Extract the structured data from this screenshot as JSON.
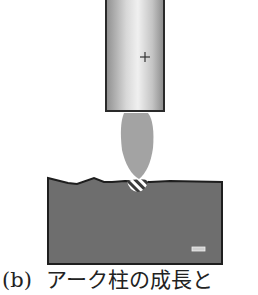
{
  "figure": {
    "electrode": {
      "polarity_symbol": "+",
      "fill_light": "#f2f2f2",
      "fill_dark": "#9a9a9a",
      "outline": "#2a2a2a"
    },
    "arc": {
      "fill": "#a3a3a3"
    },
    "base_metal": {
      "polarity_symbol": "−",
      "fill": "#6e6e6e",
      "outline": "#1e1e1e"
    },
    "weld_pool": {
      "pattern": "hatched",
      "stripe_color": "#ffffff",
      "fill": "#3a3a3a"
    }
  },
  "caption": {
    "label": "(b)",
    "text": "アーク柱の成長と"
  }
}
